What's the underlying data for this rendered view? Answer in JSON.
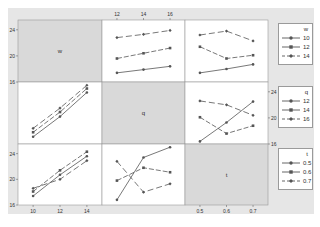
{
  "chart_data": {
    "type": "line",
    "title": "",
    "layout": "3x3 interaction plot matrix",
    "variables": [
      "w",
      "q",
      "t"
    ],
    "ticks": {
      "w": [
        "10",
        "12",
        "14"
      ],
      "q": [
        "12",
        "14",
        "16"
      ],
      "t": [
        "0.5",
        "0.6",
        "0.7"
      ],
      "y_left": [
        "24",
        "20",
        "16"
      ],
      "y_right_row2": [
        "24",
        "20",
        "16"
      ]
    },
    "grid": false,
    "legend_position": "right",
    "legends": [
      {
        "title": "w",
        "entries": [
          "10",
          "12",
          "14"
        ]
      },
      {
        "title": "q",
        "entries": [
          "12",
          "14",
          "16"
        ]
      },
      {
        "title": "t",
        "entries": [
          "0.5",
          "0.6",
          "0.7"
        ]
      }
    ],
    "panels": [
      {
        "row": 0,
        "col": 1,
        "x_var": "q",
        "group_var": "w",
        "x": [
          "12",
          "14",
          "16"
        ],
        "series": [
          {
            "name": "w=10",
            "values": [
              17.4,
              17.9,
              18.4
            ]
          },
          {
            "name": "w=12",
            "values": [
              19.6,
              20.4,
              21.2
            ]
          },
          {
            "name": "w=14",
            "values": [
              22.8,
              23.3,
              23.9
            ]
          }
        ]
      },
      {
        "row": 0,
        "col": 2,
        "x_var": "t",
        "group_var": "w",
        "x": [
          "0.5",
          "0.6",
          "0.7"
        ],
        "series": [
          {
            "name": "w=10",
            "values": [
              17.4,
              18.0,
              18.7
            ]
          },
          {
            "name": "w=12",
            "values": [
              21.4,
              19.6,
              20.1
            ]
          },
          {
            "name": "w=14",
            "values": [
              23.2,
              23.8,
              22.3
            ]
          }
        ]
      },
      {
        "row": 1,
        "col": 0,
        "x_var": "w",
        "group_var": "q",
        "x": [
          "10",
          "12",
          "14"
        ],
        "series": [
          {
            "name": "q=12",
            "values": [
              17.1,
              20.2,
              23.9
            ]
          },
          {
            "name": "q=14",
            "values": [
              17.8,
              20.9,
              24.5
            ]
          },
          {
            "name": "q=16",
            "values": [
              18.4,
              21.5,
              25.0
            ]
          }
        ]
      },
      {
        "row": 1,
        "col": 2,
        "x_var": "t",
        "group_var": "q",
        "x": [
          "0.5",
          "0.6",
          "0.7"
        ],
        "series": [
          {
            "name": "q=12",
            "values": [
              16.4,
              19.3,
              22.5
            ]
          },
          {
            "name": "q=14",
            "values": [
              20.1,
              17.6,
              18.8
            ]
          },
          {
            "name": "q=16",
            "values": [
              22.6,
              22.0,
              20.4
            ]
          }
        ]
      },
      {
        "row": 2,
        "col": 0,
        "x_var": "w",
        "group_var": "t",
        "x": [
          "10",
          "12",
          "14"
        ],
        "series": [
          {
            "name": "t=0.5",
            "values": [
              17.4,
              20.7,
              23.6
            ]
          },
          {
            "name": "t=0.6",
            "values": [
              18.1,
              21.4,
              24.3
            ]
          },
          {
            "name": "t=0.7",
            "values": [
              18.6,
              20.0,
              22.9
            ]
          }
        ]
      },
      {
        "row": 2,
        "col": 1,
        "x_var": "q",
        "group_var": "t",
        "x": [
          "12",
          "14",
          "16"
        ],
        "series": [
          {
            "name": "t=0.5",
            "values": [
              16.8,
              23.4,
              25.0
            ]
          },
          {
            "name": "t=0.6",
            "values": [
              19.8,
              21.8,
              21.1
            ]
          },
          {
            "name": "t=0.7",
            "values": [
              22.8,
              18.0,
              19.3
            ]
          }
        ]
      }
    ],
    "diagonal_labels": [
      "w",
      "q",
      "t"
    ]
  },
  "colors": {
    "background": "#e6e6e6",
    "panel": "#ffffff",
    "diagonal_panel": "#d9d9d9",
    "line": "#555555",
    "border": "#9a9a9a"
  }
}
